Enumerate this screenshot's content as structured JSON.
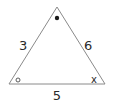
{
  "diagram": {
    "type": "triangle",
    "stroke_color": "#8a8a8a",
    "text_color": "#2a2a2a",
    "vertices": {
      "top": {
        "x": 57,
        "y": 7
      },
      "bottom_left": {
        "x": 9,
        "y": 84
      },
      "bottom_right": {
        "x": 105,
        "y": 84
      }
    },
    "sides": {
      "left": {
        "label": "3"
      },
      "right": {
        "label": "6"
      },
      "bottom": {
        "label": "5"
      }
    },
    "angles": {
      "top": {
        "marker": "filled-dot"
      },
      "bottom_left": {
        "marker": "hollow-circle"
      },
      "bottom_right": {
        "marker": "x",
        "label": "x"
      }
    }
  }
}
